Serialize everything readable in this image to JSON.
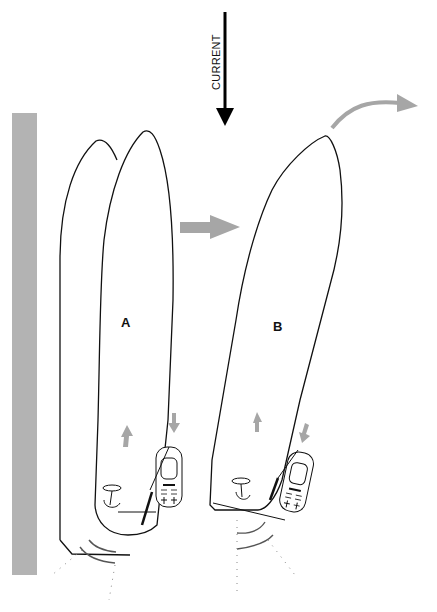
{
  "diagram": {
    "current_label": "CURRENT",
    "boat_a_label": "A",
    "boat_b_label": "B",
    "colors": {
      "wall": "#b3b3b3",
      "movement_arrow": "#a6a6a6",
      "outline": "#111111",
      "current_arrow": "#000000"
    },
    "elements": {
      "wall": "quay-wall",
      "current_arrow": "downward-current-arrow",
      "transition_arrow": "right-arrow-a-to-b",
      "turn_arrow": "curved-turn-arrow",
      "boat_a_ghost": "boat-hull-initial-position",
      "boat_a": "boat-hull-a",
      "boat_b": "boat-hull-b",
      "remote_a": "remote-control-a",
      "remote_b": "remote-control-b",
      "thrust_a": "stern-thruster-waves-a",
      "thrust_b": "stern-thruster-waves-b"
    }
  }
}
